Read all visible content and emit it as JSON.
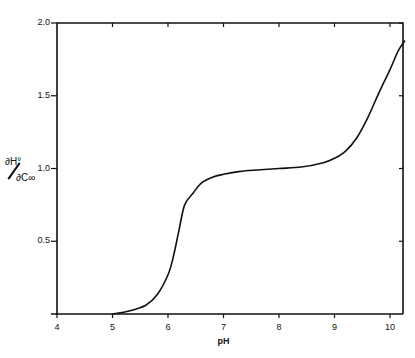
{
  "chart_data": {
    "type": "line",
    "title": "",
    "xlabel": "pH",
    "ylabel_numerator": "∂H°",
    "ylabel_denominator": "∂C∞",
    "xlim": [
      4,
      10.27
    ],
    "ylim": [
      0,
      2.0
    ],
    "xticks": [
      "4",
      "5",
      "6",
      "7",
      "8",
      "9",
      "10"
    ],
    "yticks": [
      "0.5",
      "1.0",
      "1.5",
      "2.0"
    ],
    "grid": false,
    "legend": null,
    "series": [
      {
        "name": "curve",
        "x": [
          5.0,
          5.3,
          5.6,
          5.8,
          6.0,
          6.1,
          6.2,
          6.3,
          6.45,
          6.6,
          6.8,
          7.0,
          7.3,
          7.6,
          8.0,
          8.4,
          8.8,
          9.0,
          9.2,
          9.4,
          9.6,
          9.8,
          10.0,
          10.15,
          10.27
        ],
        "y": [
          0.0,
          0.02,
          0.06,
          0.13,
          0.27,
          0.4,
          0.58,
          0.75,
          0.83,
          0.9,
          0.94,
          0.96,
          0.98,
          0.99,
          1.0,
          1.01,
          1.04,
          1.07,
          1.12,
          1.21,
          1.35,
          1.52,
          1.68,
          1.81,
          1.88
        ]
      }
    ]
  }
}
